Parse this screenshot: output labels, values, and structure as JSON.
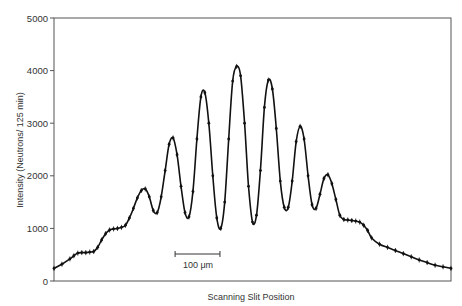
{
  "chart_data": {
    "type": "line",
    "title": "",
    "xlabel": "Scanning Slit Position",
    "ylabel": "Intensity (Neutrons/ 125 min)",
    "ylim": [
      0,
      5000
    ],
    "xlim": [
      0,
      100
    ],
    "yticks": [
      0,
      1000,
      2000,
      3000,
      4000,
      5000
    ],
    "grid": false,
    "legend": null,
    "scale_bar": {
      "label": "100 μm",
      "x_start": 30.5,
      "x_end": 41.8
    },
    "series": [
      {
        "name": "Intensity",
        "marker": "error-bar points",
        "x": [
          0,
          2,
          4,
          5,
          6,
          7,
          8,
          9,
          10,
          11,
          12,
          13,
          14,
          15,
          16,
          17,
          18,
          19,
          20,
          21,
          22,
          23,
          24,
          25,
          26,
          27,
          28,
          29,
          30,
          31,
          32,
          33,
          34,
          35,
          36,
          37,
          38,
          39,
          40,
          41,
          42,
          43,
          44,
          45,
          46,
          47,
          48,
          49,
          50,
          51,
          52,
          53,
          54,
          55,
          56,
          57,
          58,
          59,
          60,
          61,
          62,
          63,
          64,
          65,
          66,
          67,
          68,
          69,
          70,
          71,
          72,
          73,
          74,
          75,
          76,
          77,
          78,
          79,
          80,
          82,
          84,
          86,
          88,
          90,
          92,
          94,
          96,
          98,
          100
        ],
        "values": [
          240,
          320,
          420,
          480,
          530,
          540,
          540,
          550,
          560,
          640,
          780,
          900,
          970,
          990,
          1000,
          1020,
          1060,
          1200,
          1380,
          1580,
          1720,
          1750,
          1600,
          1340,
          1300,
          1600,
          2100,
          2600,
          2720,
          2400,
          1800,
          1300,
          1220,
          1700,
          2700,
          3500,
          3580,
          3000,
          2000,
          1200,
          1000,
          1500,
          2700,
          3800,
          4080,
          3900,
          3000,
          1800,
          1120,
          1250,
          2100,
          3300,
          3820,
          3650,
          2900,
          1900,
          1400,
          1400,
          1900,
          2650,
          2940,
          2700,
          2000,
          1450,
          1380,
          1650,
          1950,
          2020,
          1850,
          1550,
          1250,
          1170,
          1160,
          1150,
          1140,
          1120,
          1060,
          960,
          820,
          700,
          640,
          580,
          520,
          460,
          400,
          350,
          300,
          270,
          240
        ]
      }
    ]
  },
  "labels": {
    "ylabel": "Intensity (Neutrons/ 125 min)",
    "xlabel": "Scanning Slit Position",
    "scale_bar": "100 μm",
    "yticks": [
      "0",
      "1000",
      "2000",
      "3000",
      "4000",
      "5000"
    ]
  }
}
